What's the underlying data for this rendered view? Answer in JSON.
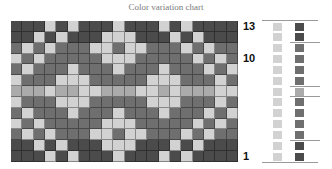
{
  "title": "Color variation chart",
  "colors": {
    "D": "#4b4b4b",
    "M": "#6f6f6f",
    "L": "#d2d2d2",
    "P": "#ababab"
  },
  "grid": {
    "rows": 13,
    "cols": 20,
    "pattern": [
      "DDDLDLDDDLDDDLDLDDDD",
      "DDLDLDDDLLLDDDLDLDDD",
      "MLMLMMMLLMLLMMMLMLMM",
      "LMLMMMMMLLLMMMMMLMLM",
      "MLMMMLMMMLMMMLMMMLML",
      "LMMMLLLMMMMMLLLMMMLM",
      "PPPLPPLLPPPLLPLPPPLL",
      "LMMMLLLMMMMMLLLMMMLM",
      "MLMMMLMMMLMMMLMMMLML",
      "LMLMMMMMLLLMMMMMLMLM",
      "MLMLMMMLLMLLMMMLMLMM",
      "DDLDLDDDLLLDDDLDLDDD",
      "DDDLDLDDDLDDDLDLDDDD"
    ]
  },
  "row_labels": [
    {
      "text": "13",
      "row": 0
    },
    {
      "text": "10",
      "row": 3
    },
    {
      "text": "1",
      "row": 12
    }
  ],
  "legend": {
    "left_column": [
      "L",
      "L",
      "L",
      "L",
      "L",
      "L",
      "L",
      "L",
      "L",
      "L",
      "L",
      "L",
      "L"
    ],
    "right_column": [
      "D",
      "D",
      "M",
      "M",
      "M",
      "M",
      "P",
      "M",
      "M",
      "M",
      "M",
      "D",
      "D"
    ],
    "dividers_after_rows": [
      2,
      6,
      7,
      11
    ]
  }
}
